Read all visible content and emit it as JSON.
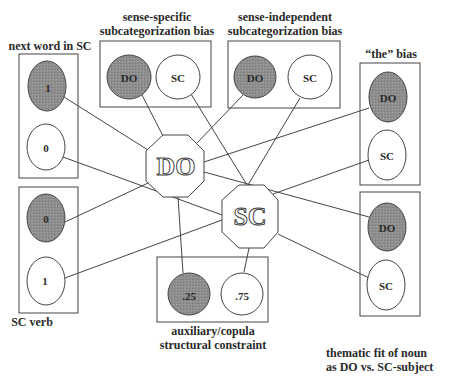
{
  "diagram": {
    "central_nodes": [
      {
        "id": "DO",
        "label": "DO"
      },
      {
        "id": "SC",
        "label": "SC"
      }
    ],
    "groups": [
      {
        "id": "next_word",
        "title": "next word in SC",
        "nodes": [
          {
            "label": "1",
            "shaded": true
          },
          {
            "label": "0",
            "shaded": false
          }
        ]
      },
      {
        "id": "sc_verb",
        "title": "SC verb",
        "nodes": [
          {
            "label": "0",
            "shaded": true
          },
          {
            "label": "1",
            "shaded": false
          }
        ]
      },
      {
        "id": "sense_specific",
        "title_line1": "sense-specific",
        "title_line2": "subcategorization bias",
        "nodes": [
          {
            "label": "DO",
            "shaded": true
          },
          {
            "label": "SC",
            "shaded": false
          }
        ]
      },
      {
        "id": "sense_independent",
        "title_line1": "sense-independent",
        "title_line2": "subcategorization bias",
        "nodes": [
          {
            "label": "DO",
            "shaded": true
          },
          {
            "label": "SC",
            "shaded": false
          }
        ]
      },
      {
        "id": "the_bias",
        "title": "“the” bias",
        "nodes": [
          {
            "label": "DO",
            "shaded": true
          },
          {
            "label": "SC",
            "shaded": false
          }
        ]
      },
      {
        "id": "thematic_fit",
        "title_line1": "thematic fit of noun",
        "title_line2": "as DO vs. SC-subject",
        "nodes": [
          {
            "label": "DO",
            "shaded": true
          },
          {
            "label": "SC",
            "shaded": false
          }
        ]
      },
      {
        "id": "aux_copula",
        "title_line1": "auxiliary/copula",
        "title_line2": "structural constraint",
        "nodes": [
          {
            "label": ".25",
            "shaded": true
          },
          {
            "label": ".75",
            "shaded": false
          }
        ]
      }
    ],
    "colors": {
      "shaded": "#8c8c8c",
      "line": "#444444",
      "background": "#ffffff"
    }
  }
}
